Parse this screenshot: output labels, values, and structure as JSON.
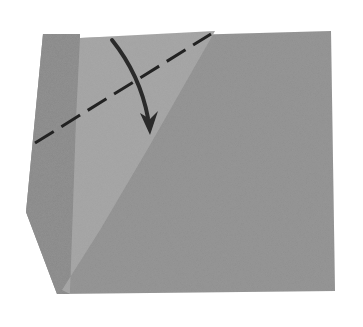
{
  "diagram": {
    "type": "origami-fold-step",
    "background_color": "#ffffff",
    "paper": {
      "main_color": "#8f8f8f",
      "left_strip_color": "#888888",
      "flap_color": "#a3a3a3",
      "outline": [
        [
          43,
          34
        ],
        [
          80,
          34
        ],
        [
          80,
          38
        ],
        [
          331,
          31
        ],
        [
          335,
          291
        ],
        [
          57,
          294
        ],
        [
          26,
          212
        ]
      ],
      "left_strip": [
        [
          43,
          34
        ],
        [
          80,
          34
        ],
        [
          80,
          38
        ],
        [
          76,
          120
        ],
        [
          70,
          294
        ],
        [
          57,
          294
        ],
        [
          26,
          212
        ]
      ],
      "light_flap": [
        [
          80,
          38
        ],
        [
          215,
          31
        ],
        [
          150,
          145
        ],
        [
          100,
          230
        ],
        [
          62,
          290
        ],
        [
          70,
          294
        ],
        [
          76,
          120
        ]
      ]
    },
    "fold_line": {
      "style": "dashed",
      "kind": "valley-fold",
      "color": "#222222",
      "from": [
        35,
        143
      ],
      "to": [
        211,
        34
      ]
    },
    "arrow": {
      "color": "#2a2a2a",
      "direction": "fold-down",
      "path": "M112 40 Q 140 75 148 118",
      "head_tip": [
        150,
        135
      ]
    }
  }
}
